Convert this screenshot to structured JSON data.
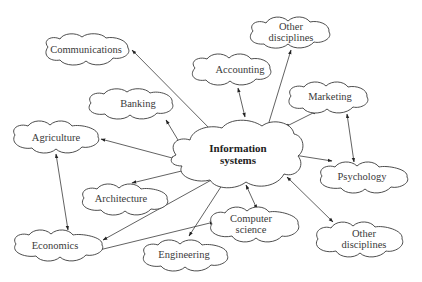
{
  "diagram": {
    "center": {
      "id": "is",
      "label_line1": "Information",
      "label_line2": "systems"
    },
    "nodes": [
      {
        "id": "communications",
        "label": "Communications"
      },
      {
        "id": "other1_line1",
        "label": "Other"
      },
      {
        "id": "other1_line2",
        "label": "disciplines"
      },
      {
        "id": "accounting",
        "label": "Accounting"
      },
      {
        "id": "banking",
        "label": "Banking"
      },
      {
        "id": "marketing",
        "label": "Marketing"
      },
      {
        "id": "agriculture",
        "label": "Agriculture"
      },
      {
        "id": "psychology",
        "label": "Psychology"
      },
      {
        "id": "architecture",
        "label": "Architecture"
      },
      {
        "id": "cs_line1",
        "label": "Computer"
      },
      {
        "id": "cs_line2",
        "label": "science"
      },
      {
        "id": "other2_line1",
        "label": "Other"
      },
      {
        "id": "other2_line2",
        "label": "disciplines"
      },
      {
        "id": "economics",
        "label": "Economics"
      },
      {
        "id": "engineering",
        "label": "Engineering"
      }
    ],
    "edges": [
      [
        "Information systems",
        "Communications"
      ],
      [
        "Information systems",
        "Other disciplines (top)"
      ],
      [
        "Information systems",
        "Accounting"
      ],
      [
        "Information systems",
        "Banking"
      ],
      [
        "Information systems",
        "Marketing"
      ],
      [
        "Information systems",
        "Agriculture"
      ],
      [
        "Information systems",
        "Psychology"
      ],
      [
        "Information systems",
        "Architecture"
      ],
      [
        "Information systems",
        "Computer science"
      ],
      [
        "Information systems",
        "Other disciplines (bottom)"
      ],
      [
        "Information systems",
        "Economics"
      ],
      [
        "Information systems",
        "Engineering"
      ],
      [
        "Agriculture",
        "Economics"
      ],
      [
        "Marketing",
        "Psychology"
      ],
      [
        "Computer science",
        "Economics"
      ]
    ]
  }
}
